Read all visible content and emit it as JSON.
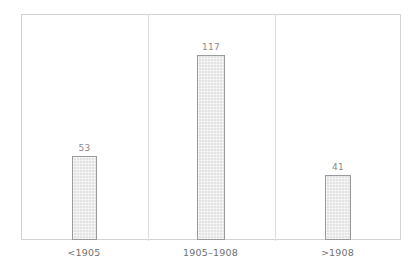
{
  "chart_data": {
    "type": "bar",
    "title": "",
    "subtitle": "",
    "xlabel": "",
    "ylabel": "",
    "categories": [
      "<1905",
      "1905–1908",
      ">1908"
    ],
    "values": [
      53,
      117,
      41
    ],
    "data_labels": [
      "53",
      "117",
      "41"
    ],
    "series": [
      {
        "name": "",
        "values": [
          53,
          117,
          41
        ]
      }
    ],
    "ylim": [
      0,
      143
    ],
    "grid": false,
    "legend": false,
    "legend_position": "none",
    "axis_ticks_y": [],
    "annotations": [],
    "style": {
      "bar_fill": "#e3e3e3",
      "bar_border": "#9a9a9a",
      "plot_border": "#d3d3d3",
      "separator": "#dedede",
      "label_color": "#8a8a8a",
      "category_color": "#6f6f6f",
      "background": "#ffffff"
    }
  }
}
